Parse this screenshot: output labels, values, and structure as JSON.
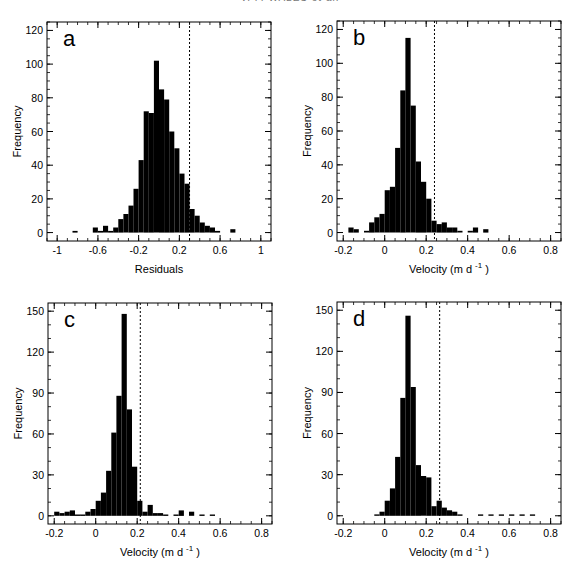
{
  "header": {
    "running_head": "V. F. WALES et al."
  },
  "chart_data": [
    {
      "id": "a",
      "type": "bar",
      "panel_label": "a",
      "title": "",
      "xlabel": "Residuals",
      "ylabel": "Frequency",
      "xlim": [
        -1.1,
        1.1
      ],
      "ylim": [
        -5,
        125
      ],
      "xticks": [
        -1,
        -0.6,
        -0.2,
        0.2,
        0.6,
        1
      ],
      "xtick_labels": [
        "-1",
        "-0.6",
        "-0.2",
        "0.2",
        "0.6",
        "1"
      ],
      "yticks": [
        0,
        20,
        40,
        60,
        80,
        100,
        120
      ],
      "ytick_labels": [
        "0",
        "20",
        "40",
        "60",
        "80",
        "100",
        "120"
      ],
      "minor_x": 0.1,
      "minor_y": 5,
      "bin_width": 0.05,
      "bins": [
        -0.85,
        -0.65,
        -0.6,
        -0.55,
        -0.5,
        -0.45,
        -0.4,
        -0.35,
        -0.3,
        -0.25,
        -0.2,
        -0.15,
        -0.1,
        -0.05,
        0.0,
        0.05,
        0.1,
        0.15,
        0.2,
        0.25,
        0.3,
        0.35,
        0.4,
        0.45,
        0.5,
        0.55,
        0.7
      ],
      "values": [
        1,
        3,
        1,
        4,
        1,
        3,
        8,
        11,
        16,
        26,
        43,
        72,
        71,
        102,
        85,
        79,
        60,
        50,
        35,
        29,
        14,
        10,
        6,
        4,
        3,
        1,
        2
      ],
      "dashed_line_x": 0.3,
      "grid": false,
      "legend": null
    },
    {
      "id": "b",
      "type": "bar",
      "panel_label": "b",
      "title": "",
      "xlabel": "Velocity (m d -1)",
      "xlabel_main": "Velocity (m d",
      "xlabel_sup": "-1",
      "xlabel_tail": ")",
      "ylabel": "Frequency",
      "xlim": [
        -0.23,
        0.85
      ],
      "ylim": [
        -5,
        125
      ],
      "xticks": [
        -0.2,
        0,
        0.2,
        0.4,
        0.6,
        0.8
      ],
      "xtick_labels": [
        "-0.2",
        "0",
        "0.2",
        "0.4",
        "0.6",
        "0.8"
      ],
      "yticks": [
        0,
        20,
        40,
        60,
        80,
        100,
        120
      ],
      "ytick_labels": [
        "0",
        "20",
        "40",
        "60",
        "80",
        "100",
        "120"
      ],
      "minor_x": 0.05,
      "minor_y": 5,
      "bin_width": 0.025,
      "bins": [
        -0.175,
        -0.15,
        -0.1,
        -0.075,
        -0.05,
        -0.025,
        0.0,
        0.025,
        0.05,
        0.075,
        0.1,
        0.125,
        0.15,
        0.175,
        0.2,
        0.225,
        0.25,
        0.275,
        0.3,
        0.325,
        0.35,
        0.4,
        0.425,
        0.475
      ],
      "values": [
        3,
        2,
        1,
        6,
        9,
        11,
        25,
        27,
        50,
        84,
        115,
        75,
        42,
        30,
        20,
        7,
        5,
        6,
        3,
        3,
        1,
        1,
        3,
        2
      ],
      "dashed_line_x": 0.24,
      "grid": false,
      "legend": null
    },
    {
      "id": "c",
      "type": "bar",
      "panel_label": "c",
      "title": "",
      "xlabel": "Velocity (m d -1)",
      "xlabel_main": "Velocity (m d",
      "xlabel_sup": "-1",
      "xlabel_tail": ")",
      "ylabel": "Frequency",
      "xlim": [
        -0.23,
        0.85
      ],
      "ylim": [
        -6,
        156
      ],
      "xticks": [
        -0.2,
        0,
        0.2,
        0.4,
        0.6,
        0.8
      ],
      "xtick_labels": [
        "-0.2",
        "0",
        "0.2",
        "0.4",
        "0.6",
        "0.8"
      ],
      "yticks": [
        0,
        30,
        60,
        90,
        120,
        150
      ],
      "ytick_labels": [
        "0",
        "30",
        "60",
        "90",
        "120",
        "150"
      ],
      "minor_x": 0.05,
      "minor_y": 10,
      "bin_width": 0.025,
      "bins": [
        -0.2,
        -0.175,
        -0.15,
        -0.125,
        -0.1,
        -0.075,
        -0.05,
        -0.025,
        0.0,
        0.025,
        0.05,
        0.075,
        0.1,
        0.125,
        0.15,
        0.175,
        0.2,
        0.225,
        0.25,
        0.275,
        0.3,
        0.325,
        0.375,
        0.4,
        0.45,
        0.5,
        0.55
      ],
      "values": [
        3,
        2,
        3,
        4,
        1,
        1,
        3,
        5,
        11,
        17,
        33,
        61,
        88,
        148,
        78,
        36,
        11,
        3,
        8,
        2,
        2,
        1,
        1,
        4,
        3,
        1,
        1
      ],
      "dashed_line_x": 0.215,
      "grid": false,
      "legend": null
    },
    {
      "id": "d",
      "type": "bar",
      "panel_label": "d",
      "title": "",
      "xlabel": "Velocity (m d -1)",
      "xlabel_main": "Velocity (m d",
      "xlabel_sup": "-1",
      "xlabel_tail": ")",
      "ylabel": "Frequency",
      "xlim": [
        -0.23,
        0.85
      ],
      "ylim": [
        -6,
        156
      ],
      "xticks": [
        -0.2,
        0,
        0.2,
        0.4,
        0.6,
        0.8
      ],
      "xtick_labels": [
        "-0.2",
        "0",
        "0.2",
        "0.4",
        "0.6",
        "0.8"
      ],
      "yticks": [
        0,
        30,
        60,
        90,
        120,
        150
      ],
      "ytick_labels": [
        "0",
        "30",
        "60",
        "90",
        "120",
        "150"
      ],
      "minor_x": 0.05,
      "minor_y": 10,
      "bin_width": 0.025,
      "bins": [
        -0.05,
        -0.025,
        0.0,
        0.025,
        0.05,
        0.075,
        0.1,
        0.125,
        0.15,
        0.175,
        0.2,
        0.225,
        0.25,
        0.275,
        0.3,
        0.325,
        0.35,
        0.45,
        0.5,
        0.55,
        0.6,
        0.65,
        0.7
      ],
      "values": [
        1,
        3,
        11,
        20,
        43,
        86,
        146,
        94,
        37,
        29,
        28,
        7,
        11,
        6,
        4,
        3,
        1,
        1,
        1,
        1,
        1,
        1,
        1
      ],
      "dashed_line_x": 0.265,
      "grid": false,
      "legend": null
    }
  ],
  "layout": {
    "panels": [
      {
        "id": "a",
        "frame": [
          47,
          22,
          271,
          241
        ]
      },
      {
        "id": "b",
        "frame": [
          337,
          21,
          561,
          241
        ]
      },
      {
        "id": "c",
        "frame": [
          48,
          303,
          272,
          524
        ]
      },
      {
        "id": "d",
        "frame": [
          337,
          302,
          561,
          524
        ]
      }
    ],
    "bar_color": "#000000",
    "frame_color": "#000000"
  }
}
